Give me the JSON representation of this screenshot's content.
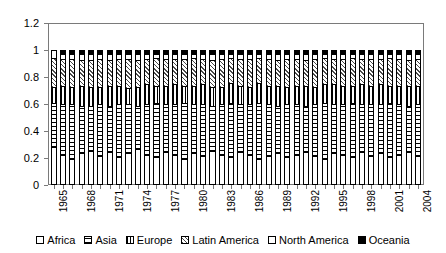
{
  "chart_data": {
    "type": "bar",
    "title": "",
    "subtitle": "",
    "xlabel": "",
    "ylabel": "",
    "stacked": true,
    "normalized": true,
    "grid": false,
    "legend_position": "bottom",
    "ylim": [
      0,
      1.2
    ],
    "y_ticks": [
      "0",
      "0.2",
      "0.4",
      "0.6",
      "0.8",
      "1",
      "1.2"
    ],
    "y_tick_values": [
      0,
      0.2,
      0.4,
      0.6,
      0.8,
      1,
      1.2
    ],
    "categories": [
      "1965",
      "1966",
      "1967",
      "1968",
      "1969",
      "1970",
      "1971",
      "1972",
      "1973",
      "1974",
      "1975",
      "1976",
      "1977",
      "1978",
      "1979",
      "1980",
      "1981",
      "1982",
      "1983",
      "1984",
      "1985",
      "1986",
      "1987",
      "1988",
      "1989",
      "1990",
      "1991",
      "1992",
      "1993",
      "1994",
      "1995",
      "1996",
      "1997",
      "1998",
      "1999",
      "2000",
      "2001",
      "2002",
      "2003",
      "2004"
    ],
    "visible_x_tick_labels": [
      "1965",
      "1968",
      "1971",
      "1974",
      "1977",
      "1980",
      "1983",
      "1986",
      "1989",
      "1992",
      "1995",
      "1998",
      "2001",
      "2004"
    ],
    "x_label_interval": 3,
    "series": [
      {
        "name": "Africa",
        "pattern": "solid-white",
        "values": [
          0.28,
          0.22,
          0.19,
          0.23,
          0.25,
          0.21,
          0.24,
          0.2,
          0.23,
          0.26,
          0.22,
          0.2,
          0.24,
          0.22,
          0.19,
          0.23,
          0.21,
          0.25,
          0.22,
          0.2,
          0.24,
          0.22,
          0.19,
          0.21,
          0.23,
          0.2,
          0.22,
          0.24,
          0.21,
          0.19,
          0.23,
          0.22,
          0.2,
          0.24,
          0.21,
          0.23,
          0.2,
          0.22,
          0.24,
          0.21
        ]
      },
      {
        "name": "Asia",
        "pattern": "horizontal-dots",
        "values": [
          0.33,
          0.38,
          0.41,
          0.36,
          0.34,
          0.39,
          0.35,
          0.4,
          0.37,
          0.33,
          0.38,
          0.41,
          0.36,
          0.38,
          0.42,
          0.37,
          0.39,
          0.34,
          0.38,
          0.41,
          0.36,
          0.38,
          0.42,
          0.39,
          0.36,
          0.4,
          0.38,
          0.35,
          0.39,
          0.42,
          0.37,
          0.38,
          0.41,
          0.36,
          0.39,
          0.37,
          0.41,
          0.38,
          0.35,
          0.39
        ]
      },
      {
        "name": "Europe",
        "pattern": "vertical-lines",
        "values": [
          0.12,
          0.14,
          0.13,
          0.15,
          0.14,
          0.13,
          0.15,
          0.14,
          0.12,
          0.14,
          0.15,
          0.13,
          0.14,
          0.15,
          0.13,
          0.14,
          0.15,
          0.14,
          0.13,
          0.15,
          0.14,
          0.13,
          0.15,
          0.14,
          0.15,
          0.13,
          0.14,
          0.15,
          0.13,
          0.14,
          0.15,
          0.14,
          0.13,
          0.15,
          0.14,
          0.15,
          0.13,
          0.14,
          0.15,
          0.14
        ]
      },
      {
        "name": "Latin America",
        "pattern": "diagonal-hatch",
        "values": [
          0.22,
          0.2,
          0.21,
          0.19,
          0.2,
          0.21,
          0.19,
          0.2,
          0.22,
          0.2,
          0.19,
          0.21,
          0.2,
          0.19,
          0.2,
          0.21,
          0.19,
          0.2,
          0.21,
          0.19,
          0.2,
          0.21,
          0.19,
          0.2,
          0.19,
          0.21,
          0.2,
          0.19,
          0.21,
          0.2,
          0.19,
          0.2,
          0.21,
          0.19,
          0.2,
          0.19,
          0.21,
          0.2,
          0.19,
          0.2
        ]
      },
      {
        "name": "North America",
        "pattern": "solid-white",
        "values": [
          0.05,
          0.04,
          0.04,
          0.05,
          0.05,
          0.04,
          0.05,
          0.04,
          0.04,
          0.05,
          0.04,
          0.03,
          0.04,
          0.04,
          0.04,
          0.03,
          0.04,
          0.05,
          0.04,
          0.03,
          0.04,
          0.04,
          0.03,
          0.04,
          0.05,
          0.04,
          0.04,
          0.05,
          0.04,
          0.03,
          0.04,
          0.04,
          0.03,
          0.04,
          0.04,
          0.04,
          0.03,
          0.04,
          0.05,
          0.04
        ]
      },
      {
        "name": "Oceania",
        "pattern": "solid-black",
        "values": [
          0.0,
          0.02,
          0.02,
          0.02,
          0.02,
          0.02,
          0.02,
          0.02,
          0.02,
          0.02,
          0.02,
          0.02,
          0.02,
          0.02,
          0.02,
          0.02,
          0.02,
          0.02,
          0.02,
          0.02,
          0.02,
          0.02,
          0.02,
          0.02,
          0.02,
          0.02,
          0.02,
          0.02,
          0.02,
          0.02,
          0.02,
          0.02,
          0.02,
          0.02,
          0.02,
          0.02,
          0.02,
          0.02,
          0.02,
          0.02
        ]
      }
    ]
  },
  "legend": {
    "items": [
      {
        "label": "Africa",
        "fill_class": "fill-africa"
      },
      {
        "label": "Asia",
        "fill_class": "fill-asia"
      },
      {
        "label": "Europe",
        "fill_class": "fill-europe"
      },
      {
        "label": "Latin America",
        "fill_class": "fill-latin"
      },
      {
        "label": "North America",
        "fill_class": "fill-north"
      },
      {
        "label": "Oceania",
        "fill_class": "fill-oceania"
      }
    ]
  },
  "colors": {
    "axis": "#7a7a7a",
    "frame": "#7a7a7a",
    "ink": "#000000",
    "background": "#ffffff"
  }
}
